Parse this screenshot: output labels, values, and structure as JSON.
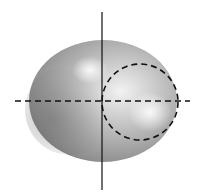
{
  "diagram": {
    "type": "3d-shaded-surface-top-view",
    "shape": {
      "kind": "torus-like shaded body",
      "center": [
        103,
        101
      ],
      "rx": 74,
      "ry": 61,
      "fill_light": "#e8e8e8",
      "fill_dark": "#7a7a7a"
    },
    "vertical_axis": {
      "x": 102,
      "y1": 12,
      "y2": 190,
      "style": "solid",
      "color": "#111111"
    },
    "horizontal_axis": {
      "y": 101,
      "x1": 15,
      "x2": 190,
      "style": "dashed",
      "color": "#111111"
    },
    "dashed_circle": {
      "cx": 140,
      "cy": 102,
      "r": 38,
      "style": "dashed",
      "color": "#111111"
    },
    "background": "#ffffff"
  }
}
